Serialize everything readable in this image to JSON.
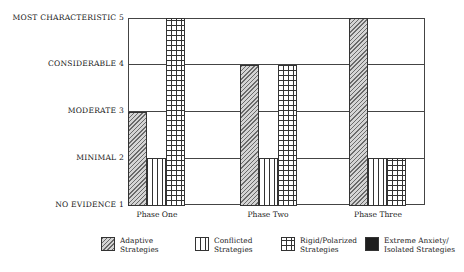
{
  "chart_data": {
    "type": "bar",
    "title": "",
    "xlabel": "",
    "ylabel": "",
    "ylim": [
      1,
      5
    ],
    "grid": true,
    "legend_position": "bottom",
    "y_ticks": [
      {
        "value": 5,
        "label": "MOST CHARACTERISTIC"
      },
      {
        "value": 4,
        "label": "CONSIDERABLE"
      },
      {
        "value": 3,
        "label": "MODERATE"
      },
      {
        "value": 2,
        "label": "MINIMAL"
      },
      {
        "value": 1,
        "label": "NO EVIDENCE"
      }
    ],
    "categories": [
      "Phase One",
      "Phase Two",
      "Phase Three"
    ],
    "series": [
      {
        "name": "Adaptive Strategies",
        "pattern": "diagonal-hatch",
        "values": [
          3,
          4,
          5
        ]
      },
      {
        "name": "Conflicted Strategies",
        "pattern": "vertical-dashed",
        "values": [
          2,
          2,
          2
        ]
      },
      {
        "name": "Rigid/Polarized Strategies",
        "pattern": "grid",
        "values": [
          5,
          4,
          2
        ]
      },
      {
        "name": "Extreme Anxiety/ Isolated Strategies",
        "pattern": "solid-black",
        "values": [
          1,
          1,
          1
        ]
      }
    ]
  },
  "yaxis": {
    "labels": [
      "MOST CHARACTERISTIC  5",
      "CONSIDERABLE  4",
      "MODERATE  3",
      "MINIMAL  2",
      "NO EVIDENCE  1"
    ]
  },
  "xaxis": {
    "labels": [
      "Phase One",
      "Phase Two",
      "Phase Three"
    ]
  },
  "legend": {
    "items": [
      {
        "label": "Adaptive Strategies"
      },
      {
        "label": "Conflicted Strategies"
      },
      {
        "label": "Rigid/Polarized Strategies"
      },
      {
        "label": "Extreme Anxiety/ Isolated Strategies"
      }
    ]
  }
}
